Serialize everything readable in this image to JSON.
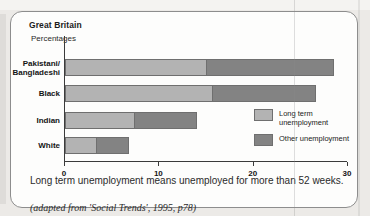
{
  "chart_data": {
    "type": "bar",
    "orientation": "horizontal",
    "stacked": true,
    "title": "Great Britain",
    "subtitle": "Percentages",
    "xlabel": "",
    "ylabel": "",
    "xlim": [
      0,
      30
    ],
    "xticks": [
      0,
      10,
      20,
      30
    ],
    "xticklabels": [
      "0",
      "10",
      "20",
      "30"
    ],
    "grid": false,
    "legend_position": "inside-right",
    "categories": [
      "Pakistani/\nBangladeshi",
      "Black",
      "Indian",
      "White"
    ],
    "series": [
      {
        "name": "Long term unemployment",
        "color": "#b3b3b3",
        "values": [
          15.1,
          15.7,
          7.4,
          3.4
        ]
      },
      {
        "name": "Other unemployment",
        "color": "#838383",
        "values": [
          13.4,
          10.9,
          6.6,
          3.4
        ]
      }
    ],
    "totals": [
      28.5,
      26.6,
      14.0,
      6.8
    ]
  },
  "header": {
    "region": "Great Britain",
    "units": "Percentages"
  },
  "axis": {
    "ticks": [
      {
        "value": 0,
        "label": "0"
      },
      {
        "value": 10,
        "label": "10"
      },
      {
        "value": 20,
        "label": "20"
      },
      {
        "value": 30,
        "label": "30"
      }
    ]
  },
  "bars": [
    {
      "category": "Pakistani/\nBangladeshi",
      "long_term": 15.1,
      "other": 13.4,
      "total": 28.5
    },
    {
      "category": "Black",
      "long_term": 15.7,
      "other": 10.9,
      "total": 26.6
    },
    {
      "category": "Indian",
      "long_term": 7.4,
      "other": 6.6,
      "total": 14.0
    },
    {
      "category": "White",
      "long_term": 3.4,
      "other": 3.4,
      "total": 6.8
    }
  ],
  "legend": {
    "items": [
      {
        "label": "Long term\nunemployment",
        "color": "#b3b3b3"
      },
      {
        "label": "Other unemployment",
        "color": "#838383"
      }
    ]
  },
  "footer": {
    "caption": "Long term unemployment means unemployed for more than 52 weeks.",
    "source": "(adapted from 'Social Trends', 1995, p78)"
  }
}
